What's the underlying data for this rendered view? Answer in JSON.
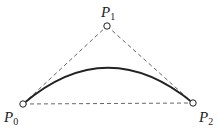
{
  "diagram": {
    "points": [
      {
        "id": "P0",
        "name": "P",
        "sub": "0"
      },
      {
        "id": "P1",
        "name": "P",
        "sub": "1"
      },
      {
        "id": "P2",
        "name": "P",
        "sub": "2"
      }
    ],
    "edges": [
      {
        "from": "P0",
        "to": "P1",
        "style": "dashed"
      },
      {
        "from": "P1",
        "to": "P2",
        "style": "dashed"
      },
      {
        "from": "P0",
        "to": "P2",
        "style": "dashed"
      }
    ],
    "curve": {
      "type": "quadratic-bezier",
      "control_points": [
        "P0",
        "P1",
        "P2"
      ],
      "style": "solid"
    },
    "colors": {
      "stroke": "#222222",
      "dash": "#555555",
      "point_fill": "#ffffff"
    }
  }
}
